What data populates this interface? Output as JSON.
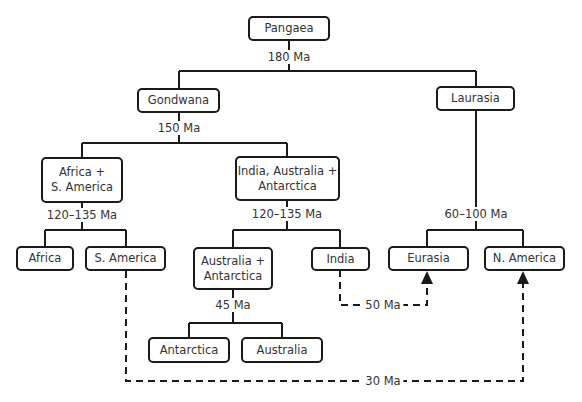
{
  "nodes": {
    "pangaea": "Pangaea",
    "gondwana": "Gondwana",
    "laurasia": "Laurasia",
    "africa_samerica": "Africa +\nS. America",
    "india_aus_ant": "India, Australia +\nAntarctica",
    "africa": "Africa",
    "samerica": "S. America",
    "aus_ant": "Australia +\nAntarctica",
    "india": "India",
    "eurasia": "Eurasia",
    "namerica": "N. America",
    "antarctica": "Antarctica",
    "australia": "Australia"
  },
  "labels": {
    "pangaea_split": "180 Ma",
    "gondwana_split": "150 Ma",
    "africa_samerica_split": "120–135 Ma",
    "india_aus_ant_split": "120–135 Ma",
    "laurasia_split": "60–100 Ma",
    "aus_ant_split": "45 Ma",
    "india_to_eurasia": "50 Ma",
    "samerica_to_namerica": "30 Ma"
  },
  "colors": {
    "line": "#1a1a1a",
    "text": "#333333",
    "background": "#ffffff"
  }
}
